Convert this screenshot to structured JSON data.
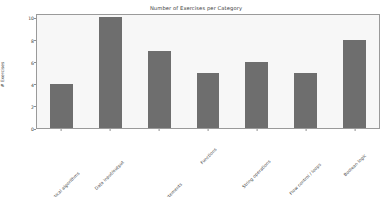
{
  "chart_data": {
    "type": "bar",
    "title": "Number of Exercises per Category",
    "xlabel": "",
    "ylabel": "# Exercises",
    "categories": [
      "Mathematical algorithms",
      "Data input/output",
      "Flow control / If-else statements",
      "Functions",
      "String operations",
      "Flow control / loops",
      "Boolean logic"
    ],
    "values": [
      4,
      10,
      7,
      5,
      6,
      5,
      8
    ],
    "ylim": [
      0,
      10.4
    ],
    "yticks": [
      0,
      2,
      4,
      6,
      8,
      10
    ],
    "ytick_labels": [
      "0",
      "2",
      "4",
      "6",
      "8",
      "10"
    ],
    "grid": false,
    "legend": false,
    "bar_color": "#6e6e6e",
    "plot_background": "#f7f7f7",
    "figure_background": "#ffffff",
    "axis_color": "#9a9a9a",
    "text_color": "#3c3c3c"
  }
}
